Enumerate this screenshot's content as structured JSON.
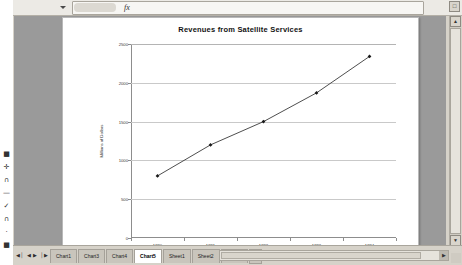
{
  "app": {
    "window_title": "Microsoft Excel",
    "name_box_value": "",
    "formula_bar_value": "",
    "fx_icon": "fx-icon",
    "namebox_caret_icon": "chevron-down-icon",
    "restore_icon": "restore-window-icon"
  },
  "left_toolbar": {
    "icons": [
      {
        "name": "square-marker-icon",
        "glyph": "■"
      },
      {
        "name": "crosshair-icon",
        "glyph": "✛"
      },
      {
        "name": "bracket-icon",
        "glyph": "∩"
      },
      {
        "name": "dash-icon",
        "glyph": "—"
      },
      {
        "name": "checkmark-icon",
        "glyph": "✓"
      },
      {
        "name": "arch-icon",
        "glyph": "∩"
      },
      {
        "name": "dot-icon",
        "glyph": "·"
      },
      {
        "name": "square-marker-icon",
        "glyph": "■"
      }
    ]
  },
  "scrollbars": {
    "vertical_up_icon": "▲",
    "vertical_down_icon": "▼",
    "horizontal_right_icon": "▶"
  },
  "sheet_tabs": {
    "nav_first_icon": "◀│",
    "nav_prev_icon": "◀",
    "nav_next_icon": "▶",
    "nav_last_icon": "│▶",
    "add_sheet_icon": "➕",
    "items": [
      {
        "label": "Chart1",
        "active": false
      },
      {
        "label": "Chart3",
        "active": false
      },
      {
        "label": "Chart4",
        "active": false
      },
      {
        "label": "Chart5",
        "active": true
      },
      {
        "label": "Sheet1",
        "active": false
      },
      {
        "label": "Sheet2",
        "active": false
      },
      {
        "label": "Sheet3",
        "active": false
      }
    ]
  },
  "chart_data": {
    "type": "line",
    "title": "Revenues from Satellite Services",
    "xlabel": "Year",
    "ylabel": "Millions of Dollars",
    "categories": [
      "1990",
      "1991",
      "1992",
      "1993",
      "1994"
    ],
    "values": [
      800,
      1200,
      1500,
      1870,
      2340
    ],
    "series": [
      {
        "name": "Revenues",
        "values": [
          800,
          1200,
          1500,
          1870,
          2340
        ]
      }
    ],
    "ylim": [
      0,
      2500
    ],
    "yticks": [
      0,
      500,
      1000,
      1500,
      2000,
      2500
    ],
    "ytick_labels": [
      "0",
      "500",
      "1000",
      "1500",
      "2000",
      "2500"
    ],
    "grid": true,
    "grid_axis": "y",
    "legend": false,
    "marker": "diamond",
    "line_color": "#3a3a3a",
    "marker_color": "#1a1a1a",
    "gridline_color": "#c9c9c9",
    "plot_bg": "#ffffff"
  }
}
